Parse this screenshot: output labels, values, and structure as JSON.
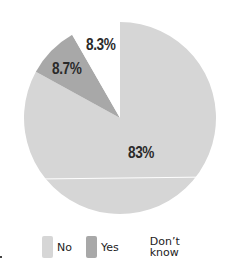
{
  "chart_data": {
    "type": "pie",
    "title": "",
    "categories": [
      "No",
      "Yes",
      "Don't know"
    ],
    "values": [
      83,
      8.7,
      8.3
    ],
    "labels": [
      "83%",
      "8.7%",
      "8.3%"
    ],
    "colors": [
      "#d6d6d6",
      "#a8a8a8",
      "#ffffff"
    ],
    "start_angle_deg": 0,
    "direction": "clockwise",
    "legend_position": "bottom"
  },
  "legend": {
    "items": [
      {
        "label": "No",
        "color": "#d6d6d6"
      },
      {
        "label": "Yes",
        "color": "#a8a8a8"
      },
      {
        "label": "Don’t know",
        "color": "#ffffff"
      }
    ]
  }
}
